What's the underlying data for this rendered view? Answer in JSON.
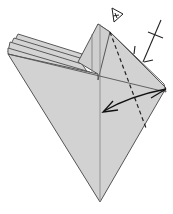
{
  "diagram": {
    "type": "origami-fold-step",
    "paper_color": "#d2d2d2",
    "line_color": "#555555",
    "symbols": [
      "valley-fold-line",
      "fold-arrow",
      "repeat-behind-mark",
      "pleat-tick-mark",
      "edge-hinge-mark"
    ]
  },
  "caption": {
    "text": ""
  }
}
